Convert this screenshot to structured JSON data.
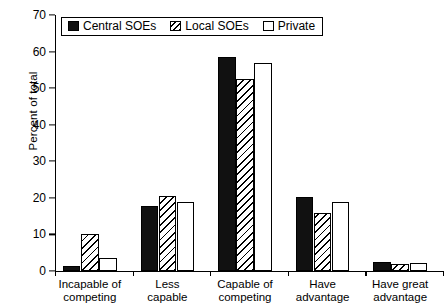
{
  "chart_data": {
    "type": "bar",
    "title": "",
    "xlabel": "",
    "ylabel": "Percent of total",
    "ylim": [
      0,
      70
    ],
    "yticks": [
      0,
      10,
      20,
      30,
      40,
      50,
      60,
      70
    ],
    "ytick_labels": [
      "0",
      "10",
      "20",
      "30",
      "40",
      "50",
      "60",
      "70"
    ],
    "grid": false,
    "legend_position": "upper left (inside axes)",
    "categories": [
      "Incapable of\ncompeting",
      "Less\ncapable",
      "Capable of\ncompeting",
      "Have\nadvantage",
      "Have great\nadvantage"
    ],
    "series": [
      {
        "name": "Central SOEs",
        "fill": "solid-black",
        "color": "#111111",
        "values": [
          1.4,
          17.7,
          58.5,
          20.3,
          2.6
        ]
      },
      {
        "name": "Local SOEs",
        "fill": "diagonal-hatch",
        "color": "#ffffff",
        "values": [
          10.2,
          20.4,
          52.5,
          15.8,
          1.8
        ]
      },
      {
        "name": "Private",
        "fill": "white",
        "color": "#ffffff",
        "values": [
          3.5,
          18.9,
          57.0,
          18.9,
          2.2
        ]
      }
    ]
  },
  "legend": {
    "items": [
      {
        "label": "Central SOEs"
      },
      {
        "label": "Local SOEs"
      },
      {
        "label": "Private"
      }
    ]
  }
}
